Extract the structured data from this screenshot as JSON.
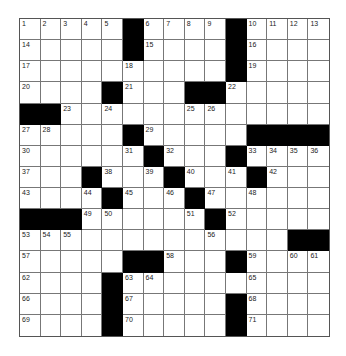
{
  "puzzle": {
    "rows": 15,
    "cols": 15,
    "grid": [
      [
        "1",
        "2",
        "3",
        "4",
        "5",
        "#",
        "6",
        "7",
        "8",
        "9",
        "#",
        "10",
        "11",
        "12",
        "13"
      ],
      [
        "14",
        "",
        "",
        "",
        "",
        "#",
        "15",
        "",
        "",
        "",
        "#",
        "16",
        "",
        "",
        ""
      ],
      [
        "17",
        "",
        "",
        "",
        "",
        "18",
        "",
        "",
        "",
        "",
        "#",
        "19",
        "",
        "",
        ""
      ],
      [
        "20",
        "",
        "",
        "",
        "#",
        "21",
        "",
        "",
        "#",
        "#",
        "22",
        "",
        "",
        "",
        ""
      ],
      [
        "#",
        "#",
        "23",
        "",
        "24",
        "",
        "",
        "",
        "25",
        "26",
        "",
        "",
        "",
        "",
        ""
      ],
      [
        "27",
        "28",
        "",
        "",
        "",
        "#",
        "29",
        "",
        "",
        "",
        "",
        "#",
        "#",
        "#",
        "#"
      ],
      [
        "30",
        "",
        "",
        "",
        "",
        "31",
        "#",
        "32",
        "",
        "",
        "#",
        "33",
        "34",
        "35",
        "36"
      ],
      [
        "37",
        "",
        "",
        "#",
        "38",
        "",
        "39",
        "#",
        "40",
        "",
        "41",
        "#",
        "42",
        "",
        ""
      ],
      [
        "43",
        "",
        "",
        "44",
        "#",
        "45",
        "",
        "46",
        "#",
        "47",
        "",
        "48",
        "",
        "",
        ""
      ],
      [
        "#",
        "#",
        "#",
        "49",
        "50",
        "",
        "",
        "",
        "51",
        "#",
        "52",
        "",
        "",
        "",
        ""
      ],
      [
        "53",
        "54",
        "55",
        "",
        "",
        "",
        "",
        "",
        "",
        "56",
        "",
        "",
        "",
        "#",
        "#"
      ],
      [
        "57",
        "",
        "",
        "",
        "",
        "#",
        "#",
        "58",
        "",
        "",
        "#",
        "59",
        "",
        "60",
        "61"
      ],
      [
        "62",
        "",
        "",
        "",
        "#",
        "63",
        "64",
        "",
        "",
        "",
        "",
        "65",
        "",
        "",
        ""
      ],
      [
        "66",
        "",
        "",
        "",
        "#",
        "67",
        "",
        "",
        "",
        "",
        "#",
        "68",
        "",
        "",
        ""
      ],
      [
        "69",
        "",
        "",
        "",
        "#",
        "70",
        "",
        "",
        "",
        "",
        "#",
        "71",
        "",
        "",
        ""
      ]
    ]
  },
  "colors": {
    "block": "#000000",
    "cell": "#ffffff",
    "gridline": "#777777"
  }
}
